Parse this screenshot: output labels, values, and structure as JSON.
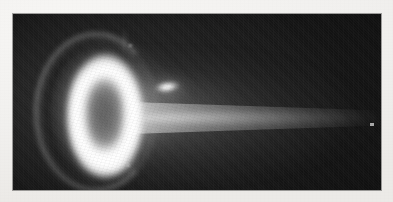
{
  "document": {
    "type": "scanned-photograph",
    "page_background_color": "#f2f1ef",
    "caption": ""
  },
  "photograph": {
    "name": "ion-thruster-firing",
    "description": "Monochrome photograph of an operating ion/plasma thruster viewed from downstream; a bright annular discharge ring at left with an exhaust plume extending to the right",
    "frame": {
      "x": 13,
      "y": 14,
      "width": 368,
      "height": 176,
      "background_color": "#1b1b1b"
    },
    "features": [
      {
        "name": "discharge-ring",
        "label": "Bright annular discharge ring",
        "center_x": 92,
        "center_y": 102,
        "outer_radius_x": 40,
        "outer_radius_y": 64,
        "peak_color": "#ffffff"
      },
      {
        "name": "ring-core",
        "label": "Dim elliptical core inside the ring",
        "center_x": 92,
        "center_y": 102,
        "radius_x": 22,
        "radius_y": 40,
        "color": "#6a6a6a"
      },
      {
        "name": "outer-crescent",
        "label": "Faint outer crescent arc along the left of the ring",
        "color": "#c8c8c8"
      },
      {
        "name": "exhaust-plume",
        "label": "Exhaust plume fading toward the right edge",
        "origin_x": 128,
        "origin_y": 104,
        "extent_x": 381,
        "color": "#cfcfcf"
      },
      {
        "name": "cathode-streak",
        "label": "Bright elongated neutralizer cathode glow",
        "center_x": 154,
        "center_y": 73,
        "color": "#ffffff"
      },
      {
        "name": "dust-speck",
        "label": "Small bright speck near the right edge",
        "center_x": 371,
        "center_y": 124,
        "color": "#ebebeb"
      }
    ],
    "palette": {
      "paper": "#f2f1ef",
      "backdrop": "#1b1b1b",
      "midtone": "#6a6a6a",
      "highlight": "#ffffff",
      "plume": "#cfcfcf"
    }
  }
}
